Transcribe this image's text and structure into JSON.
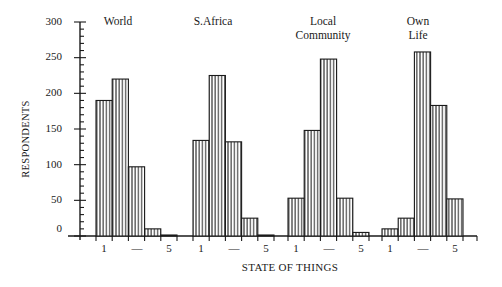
{
  "chart_data": {
    "type": "bar",
    "title": "",
    "xlabel": "STATE OF THINGS",
    "ylabel": "RESPONDENTS",
    "ylim": [
      0,
      300
    ],
    "yticks": [
      0,
      50,
      100,
      150,
      200,
      250,
      300
    ],
    "grid": false,
    "legend": null,
    "categories": [
      "1",
      "2",
      "3",
      "4",
      "5"
    ],
    "category_tick_labels": [
      "1",
      "—",
      "5"
    ],
    "bar_pattern": "vertical-hatch",
    "groups": [
      {
        "name": "World",
        "values": [
          190,
          220,
          97,
          10,
          1
        ]
      },
      {
        "name": "S.Africa",
        "values": [
          134,
          225,
          132,
          25,
          1
        ]
      },
      {
        "name": "Local Community",
        "values": [
          53,
          148,
          248,
          53,
          5
        ]
      },
      {
        "name": "Own Life",
        "values": [
          10,
          25,
          258,
          183,
          52
        ]
      }
    ]
  },
  "labels": {
    "ylabel": "RESPONDENTS",
    "xlabel": "STATE OF THINGS",
    "yticks": [
      "300",
      "250",
      "200",
      "150",
      "100",
      "50",
      "0"
    ],
    "groups": {
      "world": "World",
      "safrica": "S.Africa",
      "local_line1": "Local",
      "local_line2": "Community",
      "own_line1": "Own",
      "own_line2": "Life"
    },
    "cat_one": "1",
    "cat_dash": "—",
    "cat_five": "5"
  }
}
